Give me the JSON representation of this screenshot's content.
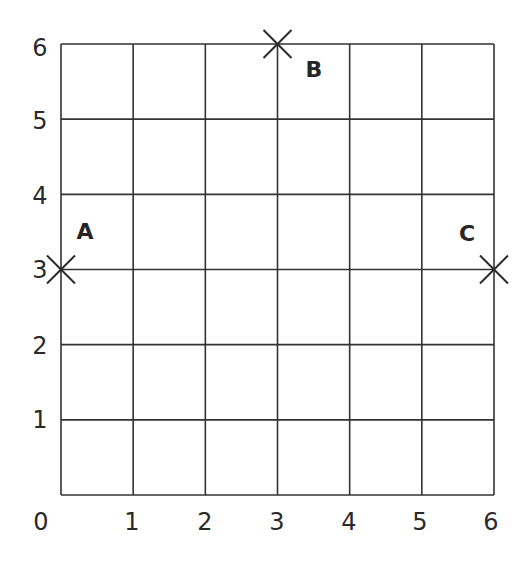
{
  "diagram": {
    "type": "coordinate-grid",
    "grid": {
      "x_min": 0,
      "x_max": 6,
      "y_min": 0,
      "y_max": 6,
      "line_color": "#333333"
    },
    "x_axis_labels": [
      "0",
      "1",
      "2",
      "3",
      "4",
      "5",
      "6"
    ],
    "y_axis_labels": [
      "1",
      "2",
      "3",
      "4",
      "5",
      "6"
    ],
    "points": [
      {
        "label": "A",
        "x": 0,
        "y": 3
      },
      {
        "label": "B",
        "x": 3,
        "y": 6
      },
      {
        "label": "C",
        "x": 6,
        "y": 3
      }
    ]
  }
}
